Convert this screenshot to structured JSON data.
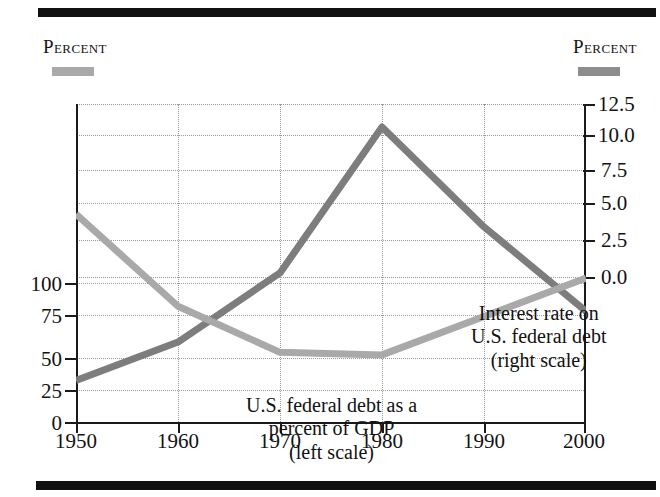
{
  "headers": {
    "left_axis_title": "Percent",
    "right_axis_title": "Percent"
  },
  "legend": {
    "left_swatch_color": "#a9a9a9",
    "right_swatch_color": "#8d8d8d"
  },
  "annotations": {
    "interest": {
      "line1": "Interest rate on",
      "line2": "U.S. federal debt",
      "line3": "(right scale)"
    },
    "debt": {
      "line1": "U.S. federal debt as a",
      "line2": "percent of GDP",
      "line3": "(left scale)"
    }
  },
  "axes": {
    "x_ticks": [
      "1950",
      "1960",
      "1970",
      "1980",
      "1990",
      "2000"
    ],
    "y_left_ticks": [
      "100",
      "75",
      "50",
      "25",
      "0"
    ],
    "y_right_ticks": [
      "12.5",
      "10.0",
      "7.5",
      "5.0",
      "2.5",
      "0.0"
    ]
  },
  "chart_data": {
    "type": "line",
    "title": "",
    "subtitle": "",
    "xlabel": "",
    "ylabel": "Percent",
    "y2label": "Percent",
    "x": [
      1950,
      1960,
      1970,
      1980,
      1990,
      2000
    ],
    "xlim": [
      1950,
      2000
    ],
    "ylim": [
      0,
      125
    ],
    "y2lim": [
      0,
      12.5
    ],
    "grid": true,
    "legend_position": "inline-annotations",
    "series": [
      {
        "name": "U.S. federal debt as a percent of GDP (left scale)",
        "axis": "left",
        "unit": "percent of GDP",
        "color": "#a9a9a9",
        "values": [
          82,
          46,
          28,
          27,
          42,
          57
        ]
      },
      {
        "name": "Interest rate on U.S. federal debt (right scale)",
        "axis": "right",
        "unit": "percent",
        "color": "#7d7d7d",
        "values": [
          1.7,
          3.2,
          5.9,
          11.6,
          7.7,
          4.4
        ]
      }
    ]
  },
  "decor": {
    "top_rule_color": "#111111",
    "bottom_rule_color": "#111111"
  }
}
